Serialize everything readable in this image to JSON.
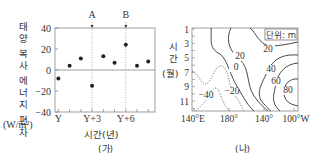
{
  "chart_data": [
    {
      "id": "ga",
      "type": "scatter",
      "panel_label": "(가)",
      "title": "",
      "ylabel_chars": [
        "태",
        "양",
        "복",
        "사",
        "에",
        "너",
        "지",
        "편",
        "차"
      ],
      "ylabel_unit": "(W/m²)",
      "ylabel": "태양 복사 에너지 편차 (W/m²)",
      "xlabel": "시간(년)",
      "xtick_labels": [
        "Y",
        "Y+3",
        "Y+6"
      ],
      "xticks_years": [
        0,
        3,
        6
      ],
      "ytick_labels": [
        "40",
        "20",
        "0",
        "−20",
        "−40"
      ],
      "yticks": [
        40,
        20,
        0,
        -20,
        -40
      ],
      "ylim": [
        -40,
        40
      ],
      "xlim": [
        -0.3,
        8.6
      ],
      "zero_line": true,
      "markers": [
        {
          "label": "A",
          "x": 3
        },
        {
          "label": "B",
          "x": 6
        }
      ],
      "x": [
        0,
        1,
        2,
        3,
        4,
        5,
        6,
        7,
        8
      ],
      "values": [
        -8,
        4,
        11,
        -15,
        13,
        7,
        24,
        4,
        8
      ]
    },
    {
      "id": "na",
      "type": "contour",
      "panel_label": "(나)",
      "unit_box": "단위: m",
      "ylabel_chars": [
        "시",
        "간"
      ],
      "ylabel_unit": "(월)",
      "ylabel": "시간(월)",
      "ytick_labels": [
        "1",
        "3",
        "5",
        "7",
        "9",
        "11"
      ],
      "xtick_labels": [
        "140°E",
        "180°",
        "140°",
        "100°W"
      ],
      "contour_levels": [
        -40,
        -20,
        0,
        20,
        40,
        60,
        80
      ],
      "contour_labels": [
        {
          "text": "20",
          "pos": "upper-right"
        },
        {
          "text": "20",
          "pos": "center"
        },
        {
          "text": "0",
          "pos": "center-left"
        },
        {
          "text": "40",
          "pos": "right"
        },
        {
          "text": "60",
          "pos": "right-lower"
        },
        {
          "text": "80",
          "pos": "lower-right"
        },
        {
          "text": "−20",
          "pos": "lower-center"
        },
        {
          "text": "−40",
          "pos": "lower-left"
        }
      ],
      "negative_dashed": true
    }
  ]
}
